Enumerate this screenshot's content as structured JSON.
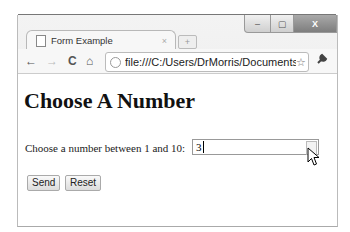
{
  "window": {
    "controls": {
      "minimize": "‒",
      "maximize": "▢",
      "close": "X"
    }
  },
  "tab": {
    "title": "Form Example",
    "close": "×",
    "new_tab": "+"
  },
  "toolbar": {
    "back": "←",
    "forward": "→",
    "reload": "C",
    "home": "⌂",
    "url": "file:///C:/Users/DrMorris/Documents/",
    "star": "☆",
    "wrench": "🔧"
  },
  "page": {
    "heading": "Choose A Number",
    "label": "Choose a number between 1 and 10:",
    "input_value": "3",
    "send_label": "Send",
    "reset_label": "Reset"
  }
}
